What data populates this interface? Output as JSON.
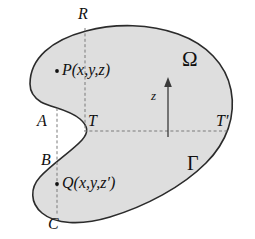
{
  "figure": {
    "type": "geometry-diagram",
    "colors": {
      "region_fill": "#dedede",
      "outline": "#2b2b2b",
      "dashed_line": "#7a7a7a",
      "axis": "#3a3a3a",
      "text": "#111111",
      "background": "#ffffff"
    },
    "region": {
      "name": "Omega",
      "label": "Ω",
      "label_x": 189,
      "label_y": 60
    },
    "boundary": {
      "name": "Gamma",
      "label": "Γ",
      "label_x": 192,
      "label_y": 163
    },
    "axis": {
      "label": "z",
      "label_x": 154,
      "label_y": 96,
      "direction": "up",
      "x": 168,
      "y_bottom": 137,
      "y_top": 80
    },
    "points": [
      {
        "id": "P",
        "name": "point-p",
        "label": "P(x,y,z)",
        "symbol": "P",
        "args": "(x,y,z)",
        "dot_x": 57,
        "dot_y": 71,
        "label_x": 62,
        "label_y": 71
      },
      {
        "id": "Q",
        "name": "point-q",
        "label": "Q(x,y,z′)",
        "symbol": "Q",
        "args": "(x,y,z′)",
        "dot_x": 57,
        "dot_y": 184,
        "label_x": 62,
        "label_y": 184
      }
    ],
    "vertices": [
      {
        "id": "R",
        "name": "vertex-r",
        "label": "R",
        "x": 83,
        "y": 14
      },
      {
        "id": "A",
        "name": "vertex-a",
        "label": "A",
        "x": 42,
        "y": 122
      },
      {
        "id": "T",
        "name": "vertex-t",
        "label": "T",
        "x": 92,
        "y": 122
      },
      {
        "id": "Tp",
        "name": "vertex-t-prime",
        "label": "T′",
        "x": 221,
        "y": 122
      },
      {
        "id": "B",
        "name": "vertex-b",
        "label": "B",
        "x": 45,
        "y": 161
      },
      {
        "id": "C",
        "name": "vertex-c",
        "label": "C",
        "x": 52,
        "y": 224
      }
    ],
    "dashed_lines": [
      {
        "name": "chord-horizontal-t-tprime",
        "orientation": "horizontal",
        "x1": 84,
        "y1": 131,
        "x2": 228,
        "y2": 131
      },
      {
        "name": "chord-vertical-r-t",
        "orientation": "vertical",
        "x1": 85,
        "y1": 28,
        "x2": 85,
        "y2": 131
      },
      {
        "name": "chord-vertical-a-c",
        "orientation": "vertical",
        "x1": 57,
        "y1": 108,
        "x2": 57,
        "y2": 215
      }
    ],
    "region_path": "M 30 84 C 30 58, 52 40, 86 31 C 116 23, 150 24, 178 34 C 206 44, 226 64, 231 90 C 236 116, 227 142, 206 163 C 182 187, 146 206, 110 217 C 80 226, 55 224, 42 213 C 30 203, 30 188, 40 177 C 52 164, 72 151, 82 140 C 89 132, 88 126, 80 119 C 68 109, 52 108, 41 102 C 33 97, 30 91, 30 84 Z"
  }
}
